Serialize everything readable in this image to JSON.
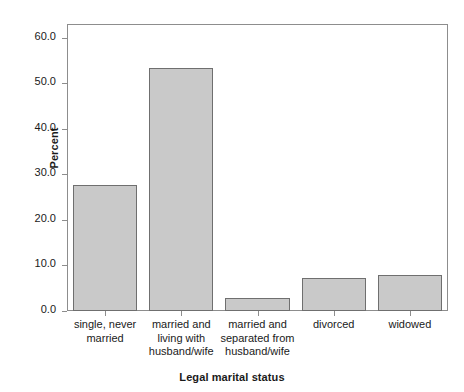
{
  "chart_data": {
    "type": "bar",
    "title": "",
    "subtitle": "",
    "xlabel": "Legal marital status",
    "ylabel": "Percent",
    "categories": [
      "single, never married",
      "married and living with husband/wife",
      "married and separated from husband/wife",
      "divorced",
      "widowed"
    ],
    "category_lines": [
      "single, never\nmarried",
      "married and\nliving with\nhusband/wife",
      "married and\nseparated from\nhusband/wife",
      "divorced",
      "widowed"
    ],
    "values": [
      27.6,
      53.3,
      2.8,
      7.2,
      7.9
    ],
    "ylim": [
      0,
      63
    ],
    "yticks": [
      0,
      10,
      20,
      30,
      40,
      50,
      60
    ],
    "ytick_labels": [
      "0.0",
      "10.0",
      "20.0",
      "30.0",
      "40.0",
      "50.0",
      "60.0"
    ],
    "grid": false,
    "legend": "none",
    "bar_fill_color": "#c9c9c9",
    "bar_border_color": "#6f6f6f",
    "frame_color": "#8d8d8d",
    "text_color": "#1a1a1a"
  }
}
